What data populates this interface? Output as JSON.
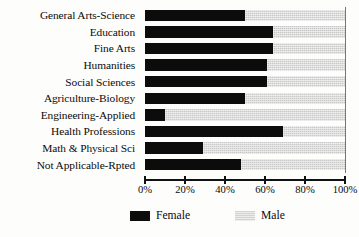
{
  "chart_data": {
    "type": "bar",
    "orientation": "horizontal",
    "stacked": true,
    "normalized_percent": true,
    "title": "",
    "xlabel": "",
    "ylabel": "",
    "xlim": [
      0,
      100
    ],
    "grid": false,
    "legend_position": "bottom",
    "categories": [
      "General Arts-Science",
      "Education",
      "Fine Arts",
      "Humanities",
      "Social Sciences",
      "Agriculture-Biology",
      "Engineering-Applied",
      "Health Professions",
      "Math & Physical Sci",
      "Not Applicable-Rpted"
    ],
    "series": [
      {
        "name": "Female",
        "color": "#0c0c0c",
        "values": [
          50,
          64,
          64,
          61,
          61,
          50,
          10,
          69,
          29,
          48
        ]
      },
      {
        "name": "Male",
        "color": "#c9c9c9",
        "values": [
          50,
          36,
          36,
          39,
          39,
          50,
          90,
          31,
          71,
          52
        ]
      }
    ],
    "xticks": [
      0,
      20,
      40,
      60,
      80,
      100
    ],
    "xticklabels": [
      "0%",
      "20%",
      "40%",
      "60%",
      "80%",
      "100%"
    ]
  },
  "legend": {
    "items": [
      {
        "label": "Female",
        "swatch": "black"
      },
      {
        "label": "Male",
        "swatch": "gray"
      }
    ]
  }
}
